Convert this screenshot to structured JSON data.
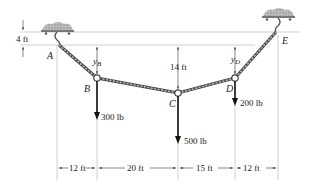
{
  "diagram": {
    "type": "cable-statics",
    "points": {
      "A": {
        "label": "A"
      },
      "B": {
        "label": "B"
      },
      "C": {
        "label": "C"
      },
      "D": {
        "label": "D"
      },
      "E": {
        "label": "E"
      }
    },
    "sag_labels": {
      "yB": {
        "main": "y",
        "sub": "B"
      },
      "yD": {
        "main": "y",
        "sub": "D"
      },
      "center": "14 ft"
    },
    "support_offset": "4 ft",
    "loads": [
      {
        "point": "B",
        "label": "300 lb"
      },
      {
        "point": "C",
        "label": "500 lb"
      },
      {
        "point": "D",
        "label": "200 lb"
      }
    ],
    "spans": [
      "12 ft",
      "20 ft",
      "15 ft",
      "12 ft"
    ],
    "colors": {
      "cable": "#8a8a8a",
      "cable_dark": "#4a4a4a",
      "ref_line": "#b5b5b5",
      "arrow": "#111111",
      "support": "#a9a9a9"
    }
  }
}
